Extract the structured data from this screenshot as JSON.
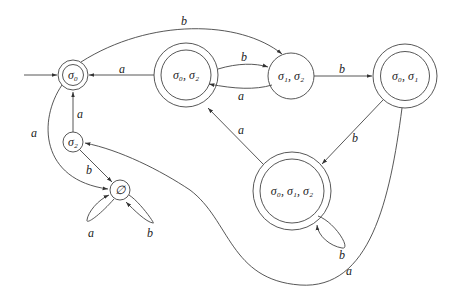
{
  "diagram": {
    "type": "finite-automaton",
    "states": [
      {
        "id": "s0",
        "label": "σ₀",
        "accepting": true,
        "start": true
      },
      {
        "id": "s02",
        "label": "σ₀, σ₂",
        "accepting": true
      },
      {
        "id": "s12",
        "label": "σ₁, σ₂",
        "accepting": false
      },
      {
        "id": "s01",
        "label": "σ₀, σ₁",
        "accepting": true
      },
      {
        "id": "s2",
        "label": "σ₂",
        "accepting": false
      },
      {
        "id": "empty",
        "label": "∅",
        "accepting": false
      },
      {
        "id": "s012",
        "label": "σ₀, σ₁, σ₂",
        "accepting": true
      }
    ],
    "transitions": [
      {
        "from": "s0",
        "to": "s12",
        "label": "b"
      },
      {
        "from": "s02",
        "to": "s0",
        "label": "a"
      },
      {
        "from": "s02",
        "to": "s12",
        "label": "b"
      },
      {
        "from": "s12",
        "to": "s02",
        "label": "a"
      },
      {
        "from": "s12",
        "to": "s01",
        "label": "b"
      },
      {
        "from": "s01",
        "to": "s012",
        "label": "b"
      },
      {
        "from": "s01",
        "to": "s2",
        "label": "a"
      },
      {
        "from": "s012",
        "to": "s02",
        "label": "a"
      },
      {
        "from": "s012",
        "to": "s012",
        "label": "b"
      },
      {
        "from": "s2",
        "to": "s0",
        "label": "a"
      },
      {
        "from": "s2",
        "to": "empty",
        "label": "b"
      },
      {
        "from": "s0",
        "to": "empty",
        "label": "a"
      },
      {
        "from": "empty",
        "to": "empty",
        "label": "a"
      },
      {
        "from": "empty",
        "to": "empty",
        "label": "b"
      }
    ]
  }
}
